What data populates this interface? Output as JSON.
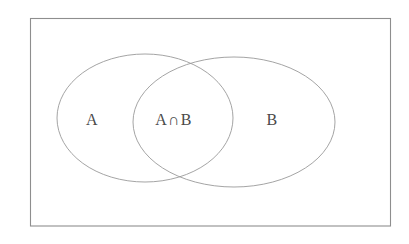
{
  "figure": {
    "type": "venn-diagram",
    "width": 409,
    "height": 244,
    "background_color": "#ffffff"
  },
  "universe": {
    "name": "universal-set-rectangle",
    "x": 30,
    "y": 18,
    "width": 361,
    "height": 208,
    "stroke_color": "#8e8e8e",
    "fill_color": "#ffffff"
  },
  "sets": [
    {
      "id": "set-a",
      "label": "A",
      "label_x": 92,
      "label_y": 125,
      "cx": 145,
      "cy": 118,
      "rx": 88,
      "ry": 64,
      "stroke_color": "#9a9a9a"
    },
    {
      "id": "set-b",
      "label": "B",
      "label_x": 272,
      "label_y": 125,
      "cx": 234,
      "cy": 122,
      "rx": 101,
      "ry": 65,
      "stroke_color": "#9a9a9a"
    }
  ],
  "intersection": {
    "id": "set-a-intersect-b",
    "label": "A∩B",
    "label_x": 174,
    "label_y": 125,
    "symbol": "∩",
    "symbol_name": "intersection-symbol"
  }
}
